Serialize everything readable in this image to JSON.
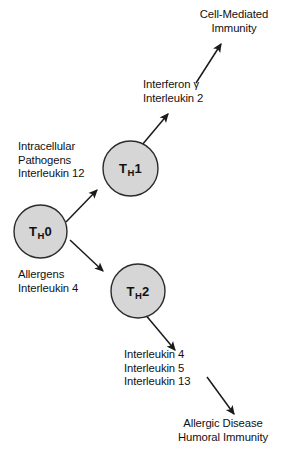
{
  "diagram": {
    "colors": {
      "cell_fill": "#d6d6d6",
      "cell_stroke": "#2b2b2b",
      "arrow": "#1a1a1a",
      "text": "#111111",
      "background": "#ffffff"
    },
    "cells": [
      {
        "id": "th0",
        "letter": "T",
        "subscript": "H",
        "number": "0",
        "label": "TH0",
        "cx": 40.5,
        "cy": 231.5,
        "r": 26.5
      },
      {
        "id": "th1",
        "letter": "T",
        "subscript": "H",
        "number": "1",
        "label": "TH1",
        "cx": 130.5,
        "cy": 168.5,
        "r": 27.5
      },
      {
        "id": "th2",
        "letter": "T",
        "subscript": "H",
        "number": "2",
        "label": "TH2",
        "cx": 138.0,
        "cy": 291.0,
        "r": 27.0
      }
    ],
    "labels": {
      "cell_mediated_immunity": {
        "name": "cell-mediated-immunity-label",
        "lines": [
          "Cell-Mediated",
          "Immunity"
        ]
      },
      "th1_cytokines": {
        "name": "th1-cytokines-label",
        "lines": [
          "Interferon γ",
          "Interleukin 2"
        ]
      },
      "th1_inducers": {
        "name": "th1-inducers-label",
        "lines": [
          "Intracellular",
          "Pathogens",
          "Interleukin 12"
        ]
      },
      "th2_inducers": {
        "name": "th2-inducers-label",
        "lines": [
          "Allergens",
          "Interleukin 4"
        ]
      },
      "th2_cytokines": {
        "name": "th2-cytokines-label",
        "lines": [
          "Interleukin 4",
          "Interleukin 5",
          "Interleukin 13"
        ]
      },
      "allergic_humoral": {
        "name": "allergic-disease-humoral-immunity-label",
        "lines": [
          "Allergic Disease",
          "Humoral Immunity"
        ]
      }
    },
    "arrows": [
      {
        "id": "th0-to-th1",
        "from": "TH0",
        "to": "TH1",
        "x1": 66,
        "y1": 222,
        "x2": 97,
        "y2": 190
      },
      {
        "id": "th0-to-th2",
        "from": "TH0",
        "to": "TH2",
        "x1": 70,
        "y1": 240,
        "x2": 103,
        "y2": 271
      },
      {
        "id": "th1-to-cytokines",
        "from": "TH1",
        "to": "Interferon γ / Interleukin 2",
        "x1": 142,
        "y1": 145,
        "x2": 168,
        "y2": 114
      },
      {
        "id": "cytokines-to-cmi",
        "from": "Interferon γ / Interleukin 2",
        "to": "Cell-Mediated Immunity",
        "x1": 196,
        "y1": 83,
        "x2": 221,
        "y2": 44
      },
      {
        "id": "th2-to-cytokines",
        "from": "TH2",
        "to": "Interleukin 4 / 5 / 13",
        "x1": 144,
        "y1": 313,
        "x2": 175,
        "y2": 350
      },
      {
        "id": "cytokines-to-allergic",
        "from": "Interleukin 4 / 5 / 13",
        "to": "Allergic Disease / Humoral Immunity",
        "x1": 207,
        "y1": 377,
        "x2": 234,
        "y2": 414
      }
    ]
  }
}
